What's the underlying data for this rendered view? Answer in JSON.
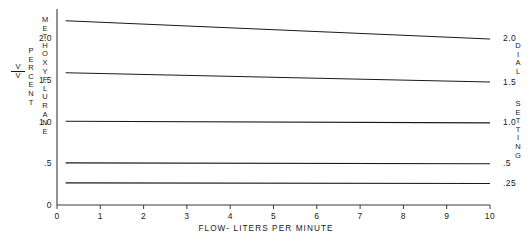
{
  "chart_data": {
    "type": "line",
    "title": "",
    "subtitle": "",
    "xlabel": "FLOW- LITERS PER MINUTE",
    "ylabel_left": "V/V PERCENT METHOXYFLURANE",
    "ylabel_right": "DIAL SETTING",
    "xlim": [
      0,
      10
    ],
    "ylim": [
      0,
      2.35
    ],
    "grid": false,
    "legend": "none",
    "x_ticks": [
      0,
      1,
      2,
      3,
      4,
      5,
      6,
      7,
      8,
      9,
      10
    ],
    "x_tick_labels": [
      "0",
      "1",
      "2",
      "3",
      "4",
      "5",
      "6",
      "7",
      "8",
      "9",
      "10"
    ],
    "y_ticks_left": [
      0,
      0.5,
      1.0,
      1.5,
      2.0
    ],
    "y_tick_labels_left": [
      "0",
      ".5",
      "1.0",
      "1.5",
      "2.0"
    ],
    "y_ticks_right": [
      0.26,
      0.5,
      1.0,
      1.48,
      2.0
    ],
    "y_tick_labels_right": [
      ".25",
      ".5",
      "1.0",
      "1.5",
      "2.0"
    ],
    "x": [
      0.2,
      10
    ],
    "series": [
      {
        "name": "2.0",
        "values": [
          2.21,
          1.99
        ]
      },
      {
        "name": "1.5",
        "values": [
          1.585,
          1.475
        ]
      },
      {
        "name": "1.0",
        "values": [
          1.005,
          0.985
        ]
      },
      {
        "name": ".5",
        "values": [
          0.505,
          0.495
        ]
      },
      {
        "name": ".25",
        "values": [
          0.265,
          0.258
        ]
      }
    ],
    "line_color": "#1a1a1a",
    "line_width": 1.1
  },
  "axes": {
    "left_label_fraction_numerator": "V",
    "left_label_fraction_denominator": "V",
    "left_label_percent": "PERCENT",
    "left_label_agent": "METHOXYFLURANE",
    "right_label_dial": "DIAL",
    "right_label_setting": "SETTING"
  }
}
